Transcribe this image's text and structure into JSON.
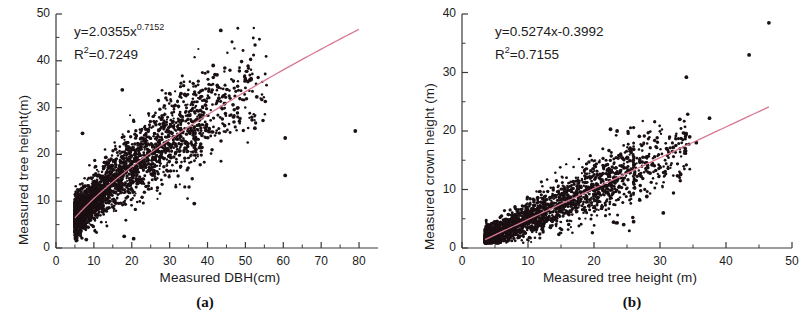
{
  "figure": {
    "panels": [
      {
        "id": "a",
        "caption": "(a)",
        "equation_main": "y=2.0355x",
        "equation_exponent": "0.7152",
        "r2_prefix": "R",
        "r2_exponent": "2",
        "r2_value": "=0.7249",
        "xlabel": "Measured DBH(cm)",
        "ylabel": "Measured tree height(m)",
        "xticks": [
          "0",
          "10",
          "20",
          "30",
          "40",
          "50",
          "60",
          "70",
          "80"
        ],
        "yticks": [
          "0",
          "10",
          "20",
          "30",
          "40",
          "50"
        ]
      },
      {
        "id": "b",
        "caption": "(b)",
        "equation_main": "y=0.5274x-0.3992",
        "equation_exponent": "",
        "r2_prefix": "R",
        "r2_exponent": "2",
        "r2_value": "=0.7155",
        "xlabel": "Measured tree height (m)",
        "ylabel": "Measured crown height (m)",
        "xticks": [
          "0",
          "10",
          "20",
          "30",
          "40",
          "50"
        ],
        "yticks": [
          "0",
          "10",
          "20",
          "30",
          "40"
        ]
      }
    ]
  },
  "colors": {
    "point": "#1a0f12",
    "fit_line": "#d8798f",
    "axis": "#3a3a3a",
    "text": "#1b1b1b"
  },
  "chart_data": [
    {
      "type": "scatter",
      "panel": "a",
      "title": "",
      "xlabel": "Measured DBH(cm)",
      "ylabel": "Measured tree height(m)",
      "xlim": [
        0,
        85
      ],
      "ylim": [
        0,
        50
      ],
      "xticks": [
        0,
        10,
        20,
        30,
        40,
        50,
        60,
        70,
        80
      ],
      "yticks": [
        0,
        10,
        20,
        30,
        40,
        50
      ],
      "minor_ticks": true,
      "grid": false,
      "legend": "none",
      "annotations": [
        "y=2.0355x^0.7152",
        "R2=0.7249"
      ],
      "fit": {
        "model": "power",
        "equation": "y = 2.0355 * x^0.7152",
        "coefficient": 2.0355,
        "exponent": 0.7152,
        "r_squared": 0.7249,
        "x_range": [
          5,
          80
        ],
        "color": "#d8798f"
      },
      "n_points_approx": 2600,
      "cloud": {
        "x_range": [
          5,
          80
        ],
        "x_dense_range": [
          5,
          38
        ],
        "y_range": [
          1.5,
          46.5
        ],
        "description": "dense dark cloud rising from (5,4) to (38,28) following the power curve, with scattered outliers to x=80"
      },
      "outliers": [
        {
          "x": 43.5,
          "y": 46.5
        },
        {
          "x": 41.5,
          "y": 39.0
        },
        {
          "x": 42.5,
          "y": 37.0
        },
        {
          "x": 50.0,
          "y": 36.0
        },
        {
          "x": 51.5,
          "y": 36.0
        },
        {
          "x": 17.5,
          "y": 33.8
        },
        {
          "x": 30.0,
          "y": 33.0
        },
        {
          "x": 33.0,
          "y": 33.0
        },
        {
          "x": 34.0,
          "y": 32.8
        },
        {
          "x": 53.0,
          "y": 32.3
        },
        {
          "x": 43.0,
          "y": 32.0
        },
        {
          "x": 52.5,
          "y": 25.6
        },
        {
          "x": 60.5,
          "y": 23.5
        },
        {
          "x": 79.0,
          "y": 25.0
        },
        {
          "x": 60.5,
          "y": 15.5
        },
        {
          "x": 36.5,
          "y": 9.5
        },
        {
          "x": 7.0,
          "y": 24.5
        },
        {
          "x": 20.5,
          "y": 2.0
        },
        {
          "x": 18.0,
          "y": 2.5
        },
        {
          "x": 8.0,
          "y": 1.8
        }
      ]
    },
    {
      "type": "scatter",
      "panel": "b",
      "title": "",
      "xlabel": "Measured tree height (m)",
      "ylabel": "Measured crown height (m)",
      "xlim": [
        0,
        50
      ],
      "ylim": [
        0,
        40
      ],
      "xticks": [
        0,
        10,
        20,
        30,
        40,
        50
      ],
      "yticks": [
        0,
        10,
        20,
        30,
        40
      ],
      "minor_ticks": true,
      "grid": false,
      "legend": "none",
      "annotations": [
        "y=0.5274x-0.3992",
        "R2=0.7155"
      ],
      "fit": {
        "model": "linear",
        "equation": "y = 0.5274 * x - 0.3992",
        "slope": 0.5274,
        "intercept": -0.3992,
        "r_squared": 0.7155,
        "x_range": [
          3.5,
          46.5
        ],
        "color": "#d8798f"
      },
      "n_points_approx": 2200,
      "cloud": {
        "x_range": [
          3.5,
          46.5
        ],
        "x_dense_range": [
          3.5,
          26
        ],
        "y_range": [
          0.8,
          38.5
        ],
        "description": "dense dark wedge rising from (4,1.5) to (26,13) along the fit line, widening with x, plus sparse outliers to x=47"
      },
      "outliers": [
        {
          "x": 46.5,
          "y": 38.5
        },
        {
          "x": 43.5,
          "y": 33.0
        },
        {
          "x": 34.0,
          "y": 29.2
        },
        {
          "x": 37.5,
          "y": 22.2
        },
        {
          "x": 33.0,
          "y": 22.0
        },
        {
          "x": 34.5,
          "y": 19.0
        },
        {
          "x": 35.5,
          "y": 18.0
        },
        {
          "x": 31.0,
          "y": 17.0
        },
        {
          "x": 32.0,
          "y": 17.2
        },
        {
          "x": 22.5,
          "y": 20.3
        },
        {
          "x": 23.5,
          "y": 20.0
        },
        {
          "x": 28.5,
          "y": 12.8
        },
        {
          "x": 30.5,
          "y": 6.0
        },
        {
          "x": 28.0,
          "y": 8.8
        },
        {
          "x": 26.0,
          "y": 4.5
        },
        {
          "x": 23.5,
          "y": 4.3
        },
        {
          "x": 24.5,
          "y": 4.0
        }
      ]
    }
  ]
}
